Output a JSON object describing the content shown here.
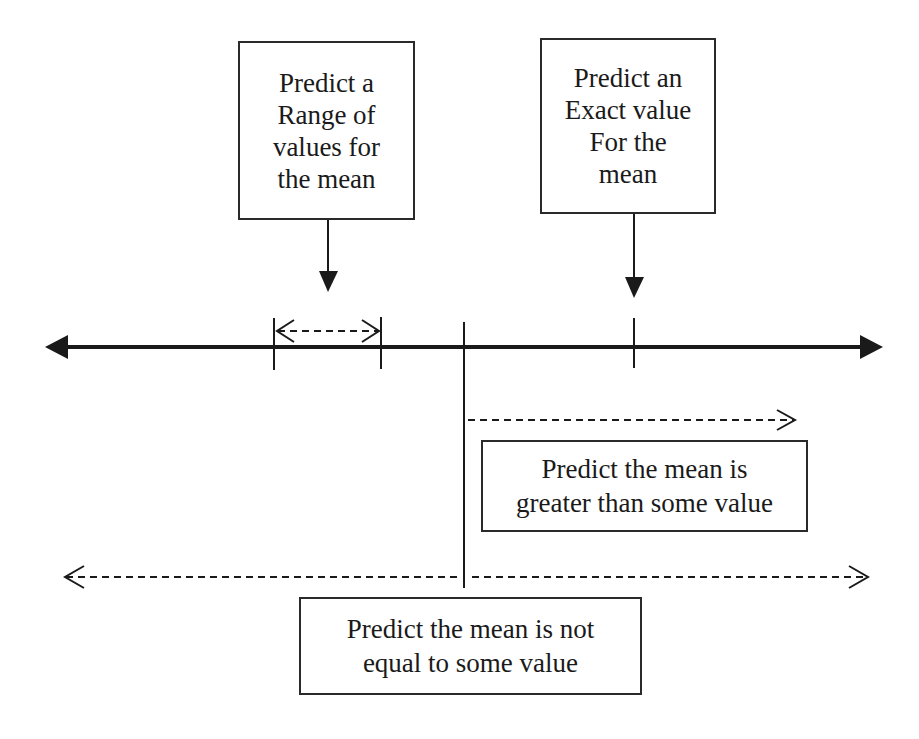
{
  "diagram": {
    "type": "hypothesis-prediction-number-line",
    "boxes": {
      "range": {
        "label": "Predict a\nRange of\nvalues for\nthe mean"
      },
      "exact": {
        "label": "Predict an\nExact value\nFor the\nmean"
      },
      "greater": {
        "label": "Predict the mean is\ngreater than some value"
      },
      "not_equal": {
        "label": "Predict the mean is not\nequal to some value"
      }
    },
    "number_line": {
      "direction": "bidirectional",
      "markers": [
        "range-lower-bound",
        "range-upper-bound",
        "hypothesized-value",
        "exact-value"
      ]
    },
    "colors": {
      "line": "#1a1a1a",
      "box_border": "#2a2a2a",
      "background": "#ffffff"
    }
  }
}
